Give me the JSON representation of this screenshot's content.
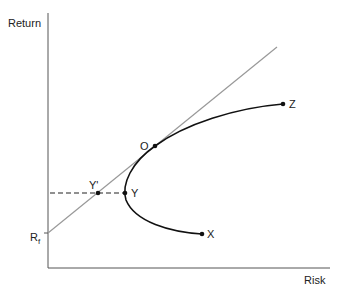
{
  "diagram": {
    "axes": {
      "y_label": "Return",
      "x_label": "Risk"
    },
    "risk_free_label": "R",
    "risk_free_subscript": "f",
    "points": {
      "O": "O",
      "Z": "Z",
      "X": "X",
      "Y": "Y",
      "Y_prime": "Y'"
    },
    "colors": {
      "axis": "#555555",
      "frontier": "#111111",
      "capital_market_line": "#999999",
      "dashed": "#222222"
    }
  }
}
